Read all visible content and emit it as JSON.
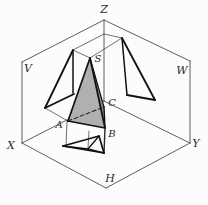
{
  "figure": {
    "palette": {
      "bg": "#fcfcfc",
      "thin": "#4d4d4d",
      "mid": "#2a2a2a",
      "thick": "#111111",
      "text": "#2b2b2b",
      "front_face": "#b0b0b0",
      "side_face": "#8c8c8c"
    },
    "labels": [
      {
        "text": "Z",
        "x": 104,
        "y": 13,
        "size": 11,
        "name": "label-axis-z"
      },
      {
        "text": "V",
        "x": 28,
        "y": 72,
        "size": 11,
        "name": "label-plane-v"
      },
      {
        "text": "W",
        "x": 182,
        "y": 74,
        "size": 11,
        "name": "label-plane-w"
      },
      {
        "text": "X",
        "x": 11,
        "y": 149,
        "size": 11,
        "name": "label-axis-x"
      },
      {
        "text": "Y",
        "x": 196,
        "y": 147,
        "size": 11,
        "name": "label-axis-y"
      },
      {
        "text": "H",
        "x": 110,
        "y": 182,
        "size": 11,
        "name": "label-plane-h"
      },
      {
        "text": "S",
        "x": 98,
        "y": 62,
        "size": 10,
        "name": "label-vertex-s"
      },
      {
        "text": "A",
        "x": 59,
        "y": 128,
        "size": 10,
        "name": "label-vertex-a"
      },
      {
        "text": "B",
        "x": 112,
        "y": 137,
        "size": 10,
        "name": "label-vertex-b"
      },
      {
        "text": "C",
        "x": 112,
        "y": 106,
        "size": 10,
        "name": "label-vertex-c"
      }
    ],
    "lines_under": [
      {
        "x1": 104,
        "y1": 20,
        "x2": 22,
        "y2": 62,
        "w": 0.9,
        "stroke": "thin",
        "name": "v-plane-top-edge"
      },
      {
        "x1": 22,
        "y1": 62,
        "x2": 22,
        "y2": 143,
        "w": 0.9,
        "stroke": "thin",
        "name": "v-plane-left-edge"
      },
      {
        "x1": 22,
        "y1": 143,
        "x2": 104,
        "y2": 101,
        "w": 0.9,
        "stroke": "thin",
        "name": "x-axis-fold-line"
      },
      {
        "x1": 104,
        "y1": 20,
        "x2": 190,
        "y2": 61,
        "w": 0.9,
        "stroke": "thin",
        "name": "w-plane-top-edge"
      },
      {
        "x1": 190,
        "y1": 61,
        "x2": 190,
        "y2": 143,
        "w": 0.9,
        "stroke": "thin",
        "name": "w-plane-right-edge"
      },
      {
        "x1": 190,
        "y1": 143,
        "x2": 104,
        "y2": 101,
        "w": 0.9,
        "stroke": "thin",
        "name": "y-axis-fold-line"
      },
      {
        "x1": 22,
        "y1": 143,
        "x2": 106,
        "y2": 188,
        "w": 0.9,
        "stroke": "thin",
        "name": "h-plane-left-bottom-edge"
      },
      {
        "x1": 190,
        "y1": 143,
        "x2": 106,
        "y2": 188,
        "w": 0.9,
        "stroke": "thin",
        "name": "h-plane-right-bottom-edge"
      },
      {
        "x1": 104,
        "y1": 20,
        "x2": 104,
        "y2": 101,
        "w": 0.9,
        "stroke": "thin",
        "name": "z-axis-line"
      },
      {
        "x1": 73,
        "y1": 50,
        "x2": 104,
        "y2": 34,
        "w": 0.8,
        "stroke": "thin",
        "name": "transfer-line-s-front-to-z"
      },
      {
        "x1": 104,
        "y1": 34,
        "x2": 122,
        "y2": 38,
        "w": 0.8,
        "stroke": "thin",
        "name": "transfer-line-z-to-s-side"
      },
      {
        "x1": 73,
        "y1": 50,
        "x2": 90,
        "y2": 58,
        "w": 0.8,
        "stroke": "thin",
        "name": "projector-sfront-to-s"
      },
      {
        "x1": 90,
        "y1": 58,
        "x2": 122,
        "y2": 38,
        "w": 0.8,
        "stroke": "thin",
        "name": "projector-s-to-sside"
      },
      {
        "x1": 45,
        "y1": 108,
        "x2": 68,
        "y2": 121,
        "w": 0.8,
        "stroke": "thin",
        "name": "projector-afront-to-a"
      },
      {
        "x1": 67,
        "y1": 121,
        "x2": 66,
        "y2": 147,
        "w": 0.8,
        "stroke": "thin",
        "name": "projector-a-to-h"
      },
      {
        "x1": 89,
        "y1": 131,
        "x2": 88,
        "y2": 148,
        "w": 0.8,
        "stroke": "thin",
        "name": "projector-s-to-h"
      }
    ],
    "polygons": [
      {
        "points": "90,58 68,121 105,128",
        "fill": "front_face",
        "name": "pyramid-front-face"
      },
      {
        "points": "90,58 105,128 104,107",
        "fill": "side_face",
        "name": "pyramid-side-face"
      }
    ],
    "lines_over": [
      {
        "x1": 68,
        "y1": 121,
        "x2": 104,
        "y2": 107,
        "w": 1.1,
        "stroke": "mid",
        "dash": "4 2.5",
        "name": "hidden-edge-a-c-dashed"
      },
      {
        "x1": 90,
        "y1": 58,
        "x2": 68,
        "y2": 121,
        "w": 1.7,
        "stroke": "thick",
        "name": "pyramid-edge-s-a"
      },
      {
        "x1": 90,
        "y1": 58,
        "x2": 105,
        "y2": 128,
        "w": 1.7,
        "stroke": "thick",
        "name": "pyramid-edge-s-b"
      },
      {
        "x1": 68,
        "y1": 121,
        "x2": 105,
        "y2": 128,
        "w": 1.7,
        "stroke": "thick",
        "name": "pyramid-edge-a-b"
      },
      {
        "x1": 105,
        "y1": 128,
        "x2": 104,
        "y2": 107,
        "w": 1.4,
        "stroke": "thick",
        "name": "pyramid-edge-b-c"
      },
      {
        "x1": 90,
        "y1": 58,
        "x2": 104,
        "y2": 107,
        "w": 1.2,
        "stroke": "thick",
        "name": "pyramid-edge-s-c"
      },
      {
        "x1": 105,
        "y1": 128,
        "x2": 104,
        "y2": 153,
        "w": 1.4,
        "stroke": "mid",
        "name": "projector-b-to-h"
      },
      {
        "x1": 73,
        "y1": 50,
        "x2": 45,
        "y2": 108,
        "w": 1.8,
        "stroke": "thick",
        "name": "v-projection-edge-left"
      },
      {
        "x1": 45,
        "y1": 108,
        "x2": 74,
        "y2": 94,
        "w": 1.8,
        "stroke": "thick",
        "name": "v-projection-edge-bottom"
      },
      {
        "x1": 73,
        "y1": 50,
        "x2": 73,
        "y2": 93,
        "w": 1.5,
        "stroke": "thick",
        "name": "v-projection-edge-right"
      },
      {
        "x1": 122,
        "y1": 38,
        "x2": 127,
        "y2": 95,
        "w": 1.5,
        "stroke": "thick",
        "name": "w-projection-edge-left"
      },
      {
        "x1": 122,
        "y1": 38,
        "x2": 155,
        "y2": 100,
        "w": 1.8,
        "stroke": "thick",
        "name": "w-projection-edge-right"
      },
      {
        "x1": 127,
        "y1": 95,
        "x2": 155,
        "y2": 100,
        "w": 1.8,
        "stroke": "thick",
        "name": "w-projection-edge-bottom"
      },
      {
        "x1": 63,
        "y1": 146,
        "x2": 99,
        "y2": 136,
        "w": 1.7,
        "stroke": "thick",
        "name": "h-projection-edge-a-c"
      },
      {
        "x1": 99,
        "y1": 136,
        "x2": 104,
        "y2": 153,
        "w": 1.7,
        "stroke": "thick",
        "name": "h-projection-edge-c-b"
      },
      {
        "x1": 104,
        "y1": 153,
        "x2": 63,
        "y2": 146,
        "w": 1.7,
        "stroke": "thick",
        "name": "h-projection-edge-b-a"
      },
      {
        "x1": 88,
        "y1": 149,
        "x2": 63,
        "y2": 146,
        "w": 1.3,
        "stroke": "thick",
        "name": "h-projection-inner-s-a"
      },
      {
        "x1": 88,
        "y1": 149,
        "x2": 99,
        "y2": 136,
        "w": 1.3,
        "stroke": "thick",
        "name": "h-projection-inner-s-c"
      },
      {
        "x1": 88,
        "y1": 149,
        "x2": 104,
        "y2": 153,
        "w": 1.3,
        "stroke": "thick",
        "name": "h-projection-inner-s-b"
      }
    ]
  }
}
